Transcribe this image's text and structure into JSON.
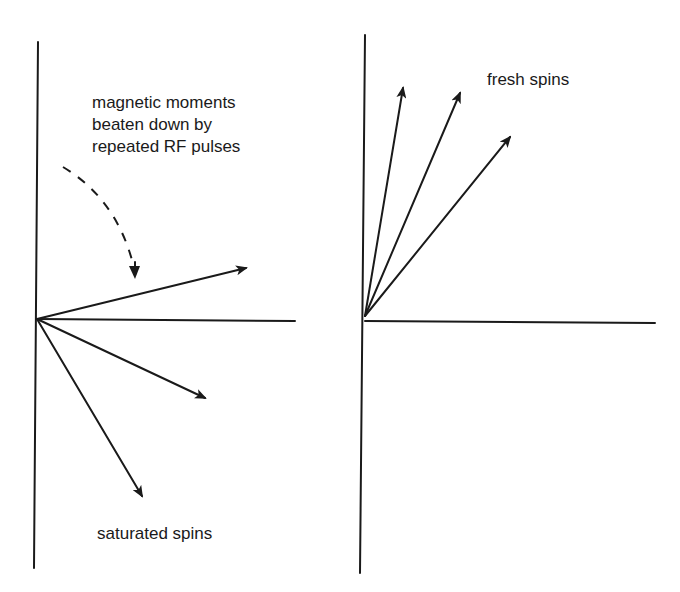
{
  "diagram": {
    "left_panel": {
      "annotation_lines": [
        "magnetic moments",
        "beaten down by",
        "repeated RF pulses"
      ],
      "bottom_label": "saturated spins",
      "vectors": 3
    },
    "right_panel": {
      "label": "fresh spins",
      "vectors": 3
    },
    "colors": {
      "ink": "#1a1a1a",
      "background": "#ffffff"
    }
  }
}
